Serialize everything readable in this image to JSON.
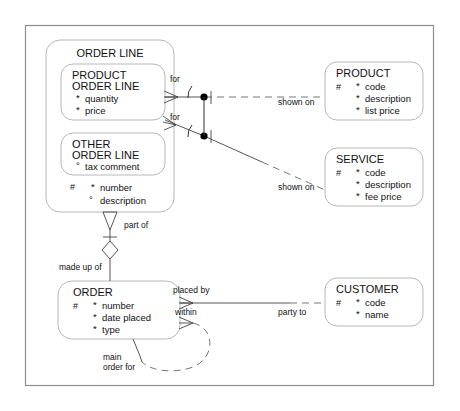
{
  "diagram": {
    "notation": "Barker",
    "frame": {
      "present": true,
      "color": "#8d8d8d"
    }
  },
  "entities": [
    {
      "id": "order_line",
      "name": "ORDER LINE",
      "attributes": [
        {
          "marker": "#",
          "optionality": "*",
          "name": "number"
        },
        {
          "marker": "",
          "optionality": "°",
          "name": "description"
        }
      ]
    },
    {
      "id": "product_order_line",
      "name_line1": "PRODUCT",
      "name_line2": "ORDER LINE",
      "attributes": [
        {
          "marker": "",
          "optionality": "*",
          "name": "quantity"
        },
        {
          "marker": "",
          "optionality": "*",
          "name": "price"
        }
      ]
    },
    {
      "id": "other_order_line",
      "name_line1": "OTHER",
      "name_line2": "ORDER LINE",
      "attributes": [
        {
          "marker": "",
          "optionality": "°",
          "name": "tax comment"
        }
      ]
    },
    {
      "id": "product",
      "name": "PRODUCT",
      "attributes": [
        {
          "marker": "#",
          "optionality": "*",
          "name": "code"
        },
        {
          "marker": "",
          "optionality": "*",
          "name": "description"
        },
        {
          "marker": "",
          "optionality": "*",
          "name": "list price"
        }
      ]
    },
    {
      "id": "service",
      "name": "SERVICE",
      "attributes": [
        {
          "marker": "#",
          "optionality": "*",
          "name": "code"
        },
        {
          "marker": "",
          "optionality": "*",
          "name": "description"
        },
        {
          "marker": "",
          "optionality": "*",
          "name": "fee price"
        }
      ]
    },
    {
      "id": "order",
      "name": "ORDER",
      "attributes": [
        {
          "marker": "#",
          "optionality": "*",
          "name": "number"
        },
        {
          "marker": "",
          "optionality": "*",
          "name": "date placed"
        },
        {
          "marker": "",
          "optionality": "*",
          "name": "type"
        }
      ]
    },
    {
      "id": "customer",
      "name": "CUSTOMER",
      "attributes": [
        {
          "marker": "#",
          "optionality": "*",
          "name": "code"
        },
        {
          "marker": "",
          "optionality": "*",
          "name": "name"
        }
      ]
    }
  ],
  "relationships": [
    {
      "id": "pol_product",
      "from_label": "for",
      "to_label": "shown on"
    },
    {
      "id": "pol_service",
      "from_label": "for",
      "to_label": "shown on"
    },
    {
      "id": "ol_order",
      "from_label": "part of",
      "to_label": "made up of"
    },
    {
      "id": "order_cust",
      "from_label": "placed by",
      "to_label": "party to"
    },
    {
      "id": "order_recurs",
      "from_label": "within",
      "to_label_line1": "main",
      "to_label_line2": "order for"
    }
  ],
  "labels": {
    "for_1": "for",
    "for_2": "for",
    "shown_on_1": "shown on",
    "shown_on_2": "shown on",
    "part_of": "part of",
    "made_up_of": "made up of",
    "placed_by": "placed by",
    "party_to": "party to",
    "within": "within",
    "main": "main",
    "order_for": "order for"
  }
}
